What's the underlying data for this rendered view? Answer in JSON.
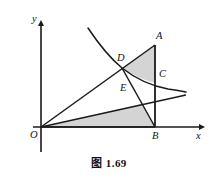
{
  "figure": {
    "caption": "图 1.69",
    "axes": {
      "x_label": "x",
      "y_label": "y",
      "origin_label": "O"
    },
    "points": [
      {
        "id": "A",
        "label": "A",
        "x": 155,
        "y": 45,
        "label_x": 156,
        "label_y": 31
      },
      {
        "id": "B",
        "label": "B",
        "x": 155,
        "y": 127,
        "label_x": 152,
        "label_y": 131
      },
      {
        "id": "C",
        "label": "C",
        "x": 155,
        "y": 83,
        "label_x": 159,
        "label_y": 69
      },
      {
        "id": "D",
        "label": "D",
        "x": 122,
        "y": 68,
        "label_x": 117,
        "label_y": 53
      },
      {
        "id": "E",
        "label": "E",
        "x": 131,
        "y": 91,
        "label_x": 120,
        "label_y": 83
      },
      {
        "id": "O",
        "label": "O",
        "x": 41,
        "y": 127,
        "label_x": 30,
        "label_y": 130
      }
    ],
    "curve": {
      "name": "hyperbola",
      "path": "M 88 28 C 100 46 110 58 122 68 C 136 79 152 86 168 89 C 176 90 181 91 186 92"
    },
    "segments": [
      {
        "name": "segment-O-A",
        "x1": 41,
        "y1": 127,
        "x2": 155,
        "y2": 45
      },
      {
        "name": "segment-O-C",
        "x1": 41,
        "y1": 127,
        "x2": 186,
        "y2": 95
      },
      {
        "name": "segment-D-B",
        "x1": 122,
        "y1": 68,
        "x2": 155,
        "y2": 127
      },
      {
        "name": "segment-A-B",
        "x1": 155,
        "y1": 45,
        "x2": 155,
        "y2": 127
      },
      {
        "name": "segment-O-B",
        "x1": 41,
        "y1": 127,
        "x2": 155,
        "y2": 127
      }
    ],
    "shaded_regions": [
      {
        "name": "region-D-A-C",
        "path": "M 122 68 L 155 45 L 155 83 L 155 83 C 146 81 133 75 122 68 Z"
      },
      {
        "name": "region-O-E-B",
        "path": "M 41 127 L 141 104 L 155 127 Z"
      }
    ],
    "axis_geometry": {
      "x_axis": {
        "x1": 33,
        "y1": 127,
        "x2": 205,
        "y2": 127
      },
      "y_axis": {
        "x1": 41,
        "y1": 152,
        "x2": 41,
        "y2": 20
      },
      "x_label_pos": {
        "x": 196,
        "y": 131
      },
      "y_label_pos": {
        "x": 32,
        "y": 14
      }
    },
    "colors": {
      "stroke": "#1a1a1a",
      "shade": "#d4d4d4",
      "background": "#ffffff",
      "text": "#111111"
    }
  }
}
